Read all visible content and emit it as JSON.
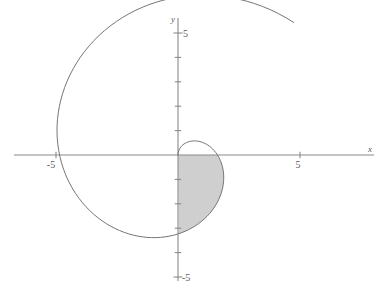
{
  "figure": {
    "kind": "polar-spiral-plot",
    "background_color": "#ffffff",
    "curve_color": "#6e6e6e",
    "axis_color": "#8a8a8a",
    "fill_color": "#cfcfcf",
    "label_color": "#5a5a5a"
  },
  "axes": {
    "x_label": "x",
    "y_label": "y",
    "x_tick_labels": [
      "-5",
      "5"
    ],
    "y_tick_labels": [
      "5",
      "-5"
    ],
    "x_ticks_values": [
      -5,
      5
    ],
    "y_ticks_values": [
      5,
      -5
    ],
    "minor_tick_values_y": [
      4,
      3,
      2,
      1,
      -1,
      -2,
      -3,
      -4
    ],
    "minor_tick_values_x": [
      -4,
      -3,
      -2,
      -1,
      1,
      2,
      3,
      4,
      6,
      7
    ],
    "xlim": [
      -7.3,
      8.7
    ],
    "ylim": [
      -5.6,
      5.4
    ],
    "origin_px": [
      178,
      155
    ],
    "scale_px_per_unit": 24.4,
    "grid": false
  },
  "chart_data": {
    "type": "line",
    "title": "",
    "xlabel": "x",
    "ylabel": "y",
    "xlim": [
      -7.3,
      8.7
    ],
    "ylim": [
      -5.6,
      5.4
    ],
    "grid": false,
    "legend_position": "none",
    "series": [
      {
        "name": "spiral r = a*theta",
        "polar": true,
        "theta_range_rad": [
          0,
          7.0
        ],
        "theta_step_rad": 0.05,
        "radius_coefficient": 1.03,
        "direction": "clockwise-from-origin",
        "notes": "Archimedean spiral starting at the origin, sweeping through the shaded first-quadrant lobe, around past x=-3.5, y=-5, x=+6.3 and ending near (5.0, 5.0)."
      }
    ],
    "shaded_region": {
      "label": "",
      "fill": "#cfcfcf",
      "theta_range_rad": [
        1.5708,
        3.1416
      ],
      "description": "Region bounded by the first arm of the spiral and the positive y-axis / positive x-axis, occupying roughly 0 <= x <= 0.85, 0 <= y <= 1.65"
    },
    "x_tick_labels": [
      "-5",
      "5"
    ],
    "y_tick_labels": [
      "5",
      "-5"
    ]
  }
}
